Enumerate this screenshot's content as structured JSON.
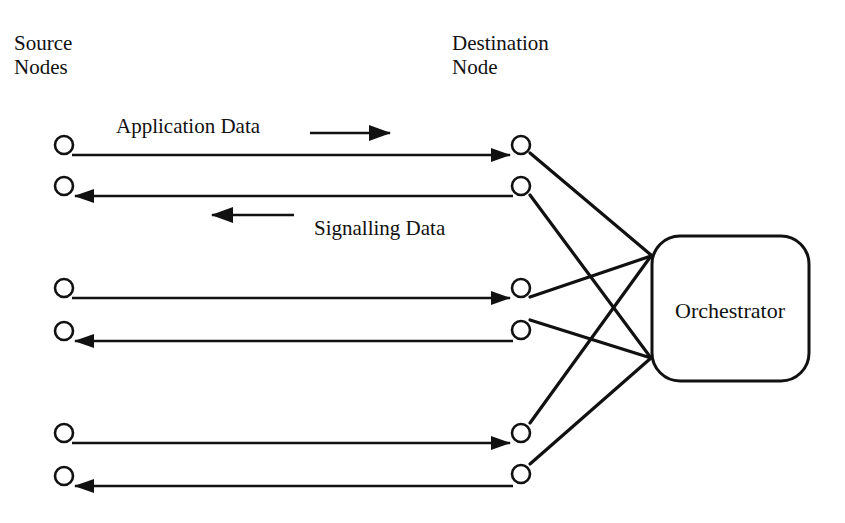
{
  "diagram": {
    "source_header": [
      "Source",
      "Nodes"
    ],
    "destination_header": [
      "Destination",
      "Node"
    ],
    "labels": {
      "application_data": "Application Data",
      "signalling_data": "Signalling Data"
    },
    "orchestrator": {
      "label": "Orchestrator"
    },
    "colors": {
      "ink": "#111111",
      "background": "#ffffff"
    },
    "channels": [
      {
        "pair": 1,
        "direction": "source-to-destination",
        "type": "application"
      },
      {
        "pair": 1,
        "direction": "destination-to-source",
        "type": "signalling"
      },
      {
        "pair": 2,
        "direction": "source-to-destination",
        "type": "application"
      },
      {
        "pair": 2,
        "direction": "destination-to-source",
        "type": "signalling"
      },
      {
        "pair": 3,
        "direction": "source-to-destination",
        "type": "application"
      },
      {
        "pair": 3,
        "direction": "destination-to-source",
        "type": "signalling"
      }
    ],
    "orchestrator_links": [
      {
        "from": "destination-1",
        "to": "orchestrator-upper"
      },
      {
        "from": "destination-2",
        "to": "orchestrator-lower"
      },
      {
        "from": "destination-3",
        "to": "orchestrator-upper"
      },
      {
        "from": "destination-4",
        "to": "orchestrator-lower"
      },
      {
        "from": "destination-5",
        "to": "orchestrator-upper"
      },
      {
        "from": "destination-6",
        "to": "orchestrator-lower"
      }
    ]
  }
}
